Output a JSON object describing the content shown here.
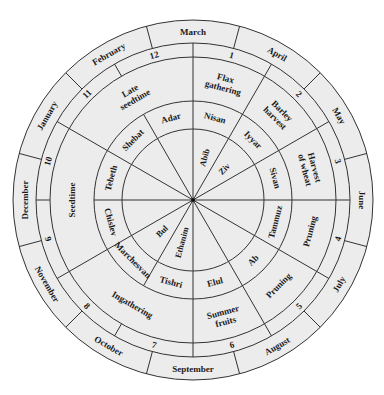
{
  "diagram": {
    "type": "circular-calendar",
    "center": [
      193,
      200
    ],
    "radii": {
      "outer": 180,
      "months_inner": 157,
      "numbers_inner": 143,
      "activities_inner": 99,
      "hebrew_inner": 71
    },
    "colors": {
      "fill": "#ececec",
      "stroke": "#333333",
      "text": "#1a1a1a",
      "background": "#ffffff"
    },
    "months": [
      "March",
      "April",
      "May",
      "June",
      "July",
      "August",
      "September",
      "October",
      "November",
      "December",
      "January",
      "February"
    ],
    "numbers": [
      "1",
      "2",
      "3",
      "4",
      "5",
      "6",
      "7",
      "8",
      "9",
      "10",
      "11",
      "12"
    ],
    "activities": [
      {
        "label": [
          "Flax",
          "gathering"
        ],
        "start": 0,
        "end": 30
      },
      {
        "label": [
          "Barley",
          "harvest"
        ],
        "start": 30,
        "end": 60
      },
      {
        "label": [
          "Harvest",
          "of wheat"
        ],
        "start": 60,
        "end": 90
      },
      {
        "label": [
          "Pruning"
        ],
        "start": 90,
        "end": 120
      },
      {
        "label": [
          "Pruning"
        ],
        "start": 120,
        "end": 150
      },
      {
        "label": [
          "Summer",
          "fruits"
        ],
        "start": 150,
        "end": 180
      },
      {
        "label": [
          "Ingathering"
        ],
        "start": 180,
        "end": 240
      },
      {
        "label": [
          "Seedtime"
        ],
        "start": 240,
        "end": 300
      },
      {
        "label": [
          "Late",
          "seedtime"
        ],
        "start": 300,
        "end": 360
      }
    ],
    "hebrew_months": [
      "Nisan",
      "Iyyar",
      "Sivan",
      "Tammuz",
      "Ab",
      "Elul",
      "Tishri",
      "Marchesvan",
      "Chislev",
      "Tebeth",
      "Shebat",
      "Adar"
    ],
    "old_names": [
      {
        "label": "Abib",
        "angle": 15
      },
      {
        "label": "Ziv",
        "angle": 45
      },
      {
        "label": "Ethanim",
        "angle": 195
      },
      {
        "label": "Bul",
        "angle": 225
      }
    ]
  }
}
